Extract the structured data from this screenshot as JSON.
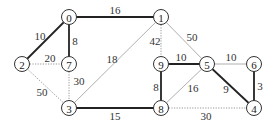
{
  "diagram": {
    "type": "weighted-undirected-graph",
    "nodes": [
      {
        "id": "0",
        "x": 69,
        "y": 17
      },
      {
        "id": "1",
        "x": 161,
        "y": 17
      },
      {
        "id": "2",
        "x": 22,
        "y": 64
      },
      {
        "id": "7",
        "x": 69,
        "y": 64
      },
      {
        "id": "9",
        "x": 161,
        "y": 64
      },
      {
        "id": "5",
        "x": 207,
        "y": 64
      },
      {
        "id": "6",
        "x": 254,
        "y": 64
      },
      {
        "id": "3",
        "x": 69,
        "y": 108
      },
      {
        "id": "8",
        "x": 161,
        "y": 108
      },
      {
        "id": "4",
        "x": 254,
        "y": 108
      }
    ],
    "edges": [
      {
        "from": "0",
        "to": "1",
        "weight": "16",
        "style": "bold",
        "lx": 115,
        "ly": 10
      },
      {
        "from": "0",
        "to": "2",
        "weight": "10",
        "style": "bold",
        "lx": 40,
        "ly": 36
      },
      {
        "from": "0",
        "to": "7",
        "weight": "8",
        "style": "bold",
        "lx": 75,
        "ly": 41
      },
      {
        "from": "2",
        "to": "7",
        "weight": "20",
        "style": "dotted",
        "lx": 50,
        "ly": 58
      },
      {
        "from": "2",
        "to": "3",
        "weight": "50",
        "style": "dotted",
        "lx": 42,
        "ly": 92
      },
      {
        "from": "7",
        "to": "3",
        "weight": "30",
        "style": "dotted",
        "lx": 79,
        "ly": 81
      },
      {
        "from": "1",
        "to": "3",
        "weight": "18",
        "style": "thin",
        "lx": 112,
        "ly": 59
      },
      {
        "from": "1",
        "to": "9",
        "weight": "42",
        "style": "dotted",
        "lx": 155,
        "ly": 41
      },
      {
        "from": "1",
        "to": "5",
        "weight": "50",
        "style": "thin",
        "lx": 192,
        "ly": 37
      },
      {
        "from": "9",
        "to": "5",
        "weight": "10",
        "style": "bold",
        "lx": 181,
        "ly": 57
      },
      {
        "from": "5",
        "to": "6",
        "weight": "10",
        "style": "thin",
        "lx": 231,
        "ly": 57
      },
      {
        "from": "9",
        "to": "8",
        "weight": "8",
        "style": "bold",
        "lx": 156,
        "ly": 87
      },
      {
        "from": "5",
        "to": "8",
        "weight": "16",
        "style": "thin",
        "lx": 193,
        "ly": 88
      },
      {
        "from": "5",
        "to": "4",
        "weight": "9",
        "style": "bold",
        "lx": 226,
        "ly": 89
      },
      {
        "from": "6",
        "to": "4",
        "weight": "3",
        "style": "bold",
        "lx": 260,
        "ly": 86
      },
      {
        "from": "3",
        "to": "8",
        "weight": "15",
        "style": "bold",
        "lx": 115,
        "ly": 116
      },
      {
        "from": "8",
        "to": "4",
        "weight": "30",
        "style": "dotted",
        "lx": 206,
        "ly": 116
      }
    ],
    "node_radius": 7.5
  }
}
